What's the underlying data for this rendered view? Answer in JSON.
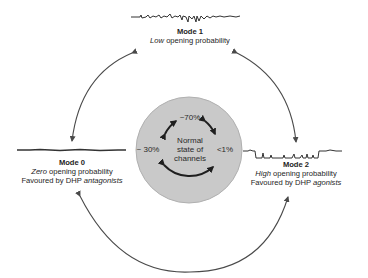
{
  "colors": {
    "background": "#ffffff",
    "circle_fill": "#c9c9c9",
    "circle_stroke": "#a8a8a8",
    "arrow": "#4a4a4a",
    "inner_arrow": "#1f1f1f",
    "trace": "#333333"
  },
  "center": {
    "title_lines": [
      "Normal",
      "state of",
      "channels"
    ],
    "top_pct": "~70%",
    "left_pct": "~ 30%",
    "right_pct": "<1%"
  },
  "modes": [
    {
      "id": "mode1",
      "title": "Mode 1",
      "desc_italic": "Low",
      "desc_rest": " opening probability",
      "line2_prefix": "",
      "line2_italic": "",
      "trace": "low-openings"
    },
    {
      "id": "mode0",
      "title": "Mode 0",
      "desc_italic": "Zero",
      "desc_rest": " opening probability",
      "line2_prefix": "Favoured by DHP ",
      "line2_italic": "antagonists",
      "trace": "flat"
    },
    {
      "id": "mode2",
      "title": "Mode 2",
      "desc_italic": "High",
      "desc_rest": " opening probability",
      "line2_prefix": "Favoured by DHP ",
      "line2_italic": "agonists",
      "trace": "long-openings"
    }
  ],
  "transitions": [
    {
      "from": "Mode 1",
      "to": "Mode 0",
      "bidirectional": true
    },
    {
      "from": "Mode 1",
      "to": "Mode 2",
      "bidirectional": true
    },
    {
      "from": "Mode 0",
      "to": "Mode 2",
      "bidirectional": true
    }
  ]
}
